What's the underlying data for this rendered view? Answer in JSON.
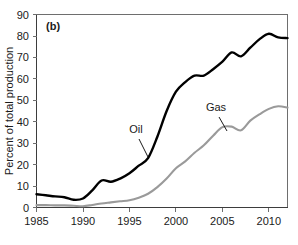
{
  "chart_data": {
    "type": "line",
    "title": "",
    "panel_label": "(b)",
    "xlabel": "",
    "ylabel": "Percent of total production",
    "xlim": [
      1985,
      2012
    ],
    "ylim": [
      0,
      90
    ],
    "xticks": [
      1985,
      1990,
      1995,
      2000,
      2005,
      2010
    ],
    "yticks": [
      0,
      10,
      20,
      30,
      40,
      50,
      60,
      70,
      80,
      90
    ],
    "grid": false,
    "legend_position": "inline-annotations",
    "x": [
      1985,
      1986,
      1987,
      1988,
      1989,
      1990,
      1991,
      1992,
      1993,
      1994,
      1995,
      1996,
      1997,
      1998,
      1999,
      2000,
      2001,
      2002,
      2003,
      2004,
      2005,
      2006,
      2007,
      2008,
      2009,
      2010,
      2011,
      2012
    ],
    "series": [
      {
        "name": "Oil",
        "color": "#000000",
        "values": [
          6.2,
          5.7,
          5.2,
          4.8,
          3.6,
          4.2,
          8.0,
          12.6,
          12.0,
          13.5,
          16.0,
          19.5,
          23.0,
          33.0,
          45.0,
          54.0,
          58.5,
          61.5,
          61.5,
          64.5,
          68.0,
          72.3,
          70.5,
          74.5,
          78.5,
          81.0,
          79.3,
          79.0
        ]
      },
      {
        "name": "Gas",
        "color": "#9a9a9a",
        "values": [
          1.1,
          1.1,
          1.0,
          1.0,
          0.8,
          0.6,
          1.2,
          1.9,
          2.4,
          2.9,
          3.4,
          4.6,
          6.4,
          9.5,
          13.5,
          18.3,
          21.5,
          25.5,
          29.0,
          33.5,
          37.5,
          37.7,
          36.0,
          40.5,
          43.5,
          46.0,
          47.2,
          46.6
        ]
      }
    ],
    "annotations": [
      {
        "text": "Oil",
        "x": 1996.3,
        "y": 40.5
      },
      {
        "text": "Gas",
        "x": 2004.9,
        "y": 49.0
      }
    ]
  }
}
